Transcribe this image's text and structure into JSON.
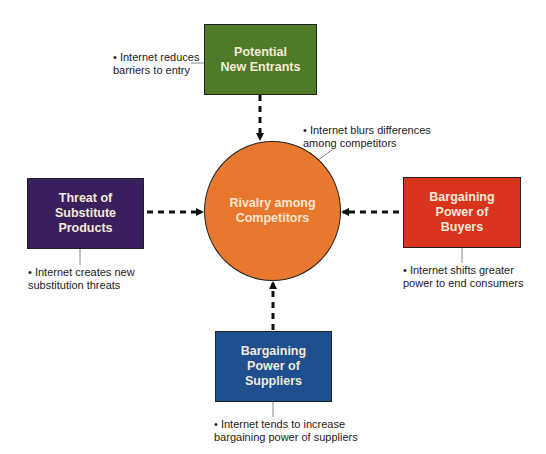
{
  "diagram": {
    "center": {
      "label": "Rivalry among\nCompetitors",
      "color": "#e8782e",
      "note": "• Internet blurs differences\n  among competitors"
    },
    "forces": {
      "new_entrants": {
        "label": "Potential\nNew Entrants",
        "color": "#4f7a2a",
        "note": "• Internet reduces\n  barriers to entry"
      },
      "substitutes": {
        "label": "Threat of\nSubstitute\nProducts",
        "color": "#3a1f5e",
        "note": "• Internet creates new\n  substitution threats"
      },
      "buyers": {
        "label": "Bargaining\nPower of\nBuyers",
        "color": "#d9341e",
        "note": "• Internet shifts greater\n  power to end consumers"
      },
      "suppliers": {
        "label": "Bargaining\nPower of\nSuppliers",
        "color": "#1f4f8e",
        "note": "• Internet tends to increase\n  bargaining power of suppliers"
      }
    },
    "arrows": [
      {
        "from": "Potential New Entrants",
        "to": "Rivalry among Competitors",
        "style": "dashed"
      },
      {
        "from": "Threat of Substitute Products",
        "to": "Rivalry among Competitors",
        "style": "dashed"
      },
      {
        "from": "Bargaining Power of Buyers",
        "to": "Rivalry among Competitors",
        "style": "dashed"
      },
      {
        "from": "Bargaining Power of Suppliers",
        "to": "Rivalry among Competitors",
        "style": "dashed"
      }
    ]
  }
}
